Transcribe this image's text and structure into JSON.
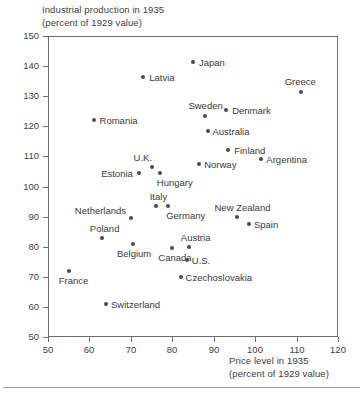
{
  "chart_data": {
    "type": "scatter",
    "title": "",
    "ylabel": "Industrial production in 1935",
    "ylabel_sub": "(percent of 1929 value)",
    "xlabel": "Price level in 1935",
    "xlabel_sub": "(percent of 1929 value)",
    "xlim": [
      50,
      120
    ],
    "ylim": [
      50,
      150
    ],
    "xticks": [
      50,
      60,
      70,
      80,
      90,
      100,
      110,
      120
    ],
    "yticks": [
      50,
      60,
      70,
      80,
      90,
      100,
      110,
      120,
      130,
      140,
      150
    ],
    "grid": false,
    "legend": "none",
    "marker_color": "#4a4a4a",
    "frame_color": "#6d6d6d",
    "points": [
      {
        "label": "Japan",
        "x": 85.0,
        "y": 141.5,
        "lx": 6,
        "ly": -4
      },
      {
        "label": "Latvia",
        "x": 73.0,
        "y": 136.5,
        "lx": 6,
        "ly": -4
      },
      {
        "label": "Greece",
        "x": 111.0,
        "y": 131.5,
        "lx": -16,
        "ly": -15
      },
      {
        "label": "Denmark",
        "x": 93.0,
        "y": 125.5,
        "lx": 6,
        "ly": -4
      },
      {
        "label": "Sweden",
        "x": 88.0,
        "y": 123.5,
        "lx": -17,
        "ly": -15
      },
      {
        "label": "Romania",
        "x": 61.0,
        "y": 122.0,
        "lx": 6,
        "ly": -4
      },
      {
        "label": "Australia",
        "x": 88.5,
        "y": 118.5,
        "lx": 5,
        "ly": -4
      },
      {
        "label": "Finland",
        "x": 93.5,
        "y": 112.0,
        "lx": 6,
        "ly": -4
      },
      {
        "label": "Argentina",
        "x": 101.5,
        "y": 109.0,
        "lx": 5,
        "ly": -4
      },
      {
        "label": "Norway",
        "x": 86.5,
        "y": 107.5,
        "lx": 5,
        "ly": -4
      },
      {
        "label": "U.K.",
        "x": 75.0,
        "y": 106.5,
        "lx": -18,
        "ly": -14
      },
      {
        "label": "Estonia",
        "x": 72.0,
        "y": 104.5,
        "lx": -38,
        "ly": -4
      },
      {
        "label": "Hungary",
        "x": 77.0,
        "y": 104.5,
        "lx": -3,
        "ly": 5
      },
      {
        "label": "Italy",
        "x": 76.0,
        "y": 93.5,
        "lx": -6,
        "ly": -14
      },
      {
        "label": "Germany",
        "x": 79.0,
        "y": 93.5,
        "lx": -2,
        "ly": 5
      },
      {
        "label": "New Zealand",
        "x": 95.5,
        "y": 90.0,
        "lx": -22,
        "ly": -14
      },
      {
        "label": "Netherlands",
        "x": 70.0,
        "y": 89.5,
        "lx": -56,
        "ly": -12
      },
      {
        "label": "Spain",
        "x": 98.5,
        "y": 87.5,
        "lx": 5,
        "ly": -4
      },
      {
        "label": "Poland",
        "x": 63.0,
        "y": 83.0,
        "lx": -12,
        "ly": -14
      },
      {
        "label": "Belgium",
        "x": 70.5,
        "y": 81.0,
        "lx": -16,
        "ly": 5
      },
      {
        "label": "Austria",
        "x": 84.0,
        "y": 80.0,
        "lx": -8,
        "ly": -14
      },
      {
        "label": "Canada",
        "x": 80.0,
        "y": 79.5,
        "lx": -14,
        "ly": 5
      },
      {
        "label": "U.S.",
        "x": 83.5,
        "y": 75.5,
        "lx": 5,
        "ly": -4
      },
      {
        "label": "France",
        "x": 55.0,
        "y": 72.0,
        "lx": -10,
        "ly": 5
      },
      {
        "label": "Czechoslovakia",
        "x": 82.0,
        "y": 70.0,
        "lx": 5,
        "ly": -4
      },
      {
        "label": "Switzerland",
        "x": 64.0,
        "y": 61.0,
        "lx": 5,
        "ly": -4
      }
    ]
  }
}
